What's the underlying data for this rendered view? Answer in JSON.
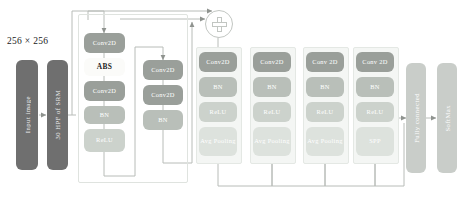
{
  "figure": {
    "type": "neural-network-architecture-diagram",
    "input_caption": "256 × 256"
  },
  "input_stage": {
    "blocks": [
      {
        "label": "Input image",
        "style": "dark"
      },
      {
        "label": "30 HPF of SRM",
        "style": "dark"
      }
    ]
  },
  "adder": {
    "symbol": "+",
    "name": "element-wise-addition"
  },
  "columns": [
    {
      "name": "block-1",
      "nodes": [
        {
          "label": "Conv2D",
          "tone": "dark"
        },
        {
          "label": "ABS",
          "tone": "white"
        },
        {
          "label": "Conv2D",
          "tone": "dark"
        },
        {
          "label": "BN",
          "tone": "mid"
        },
        {
          "label": "ReLU",
          "tone": "light"
        }
      ]
    },
    {
      "name": "block-2",
      "nodes": [
        {
          "label": "Conv2D",
          "tone": "dark"
        },
        {
          "label": "Conv2D",
          "tone": "dark"
        },
        {
          "label": "BN",
          "tone": "mid"
        }
      ]
    },
    {
      "name": "block-3",
      "nodes": [
        {
          "label": "Conv2D",
          "tone": "dark"
        },
        {
          "label": "BN",
          "tone": "mid"
        },
        {
          "label": "ReLU",
          "tone": "light"
        },
        {
          "label": "Avg Pooling",
          "tone": "pale"
        }
      ]
    },
    {
      "name": "block-4",
      "nodes": [
        {
          "label": "Conv2D",
          "tone": "dark"
        },
        {
          "label": "BN",
          "tone": "mid"
        },
        {
          "label": "ReLU",
          "tone": "light"
        },
        {
          "label": "Avg Pooling",
          "tone": "pale"
        }
      ]
    },
    {
      "name": "block-5",
      "nodes": [
        {
          "label": "Conv 2D",
          "tone": "dark"
        },
        {
          "label": "BN",
          "tone": "mid"
        },
        {
          "label": "ReLU",
          "tone": "light"
        },
        {
          "label": "Avg Pooling",
          "tone": "pale"
        }
      ]
    },
    {
      "name": "block-6",
      "nodes": [
        {
          "label": "Conv 2D",
          "tone": "dark"
        },
        {
          "label": "BN",
          "tone": "mid"
        },
        {
          "label": "ReLU",
          "tone": "light"
        },
        {
          "label": "SPP",
          "tone": "pale"
        }
      ]
    }
  ],
  "output_stage": {
    "blocks": [
      {
        "label": "Fully connected",
        "style": "pale"
      },
      {
        "label": "SoftMax",
        "style": "pale"
      }
    ]
  },
  "colors": {
    "slab_dark": "#6f6f6f",
    "slab_pale": "#c9cdc9",
    "node_dark": "#9a9f9a",
    "node_mid": "#b9bfb9",
    "node_light": "#ccd2cc",
    "node_pale": "#dde2dd",
    "node_white": "#fbfbf9",
    "wire": "#b8bcb8",
    "panel_bg": "#f4f6f4"
  }
}
